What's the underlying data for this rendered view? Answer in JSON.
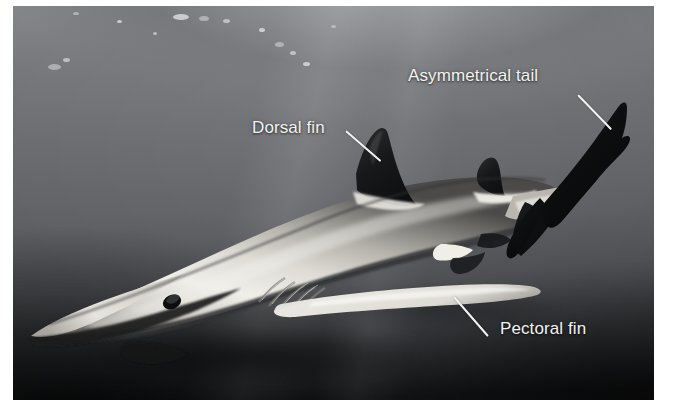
{
  "figure": {
    "kind": "photograph-with-callout-labels",
    "background_color": "#ffffff",
    "photo": {
      "left": 13,
      "top": 6,
      "width": 641,
      "height": 394,
      "water_color_light": "#8c8e91",
      "water_color_mid": "#65676b",
      "water_color_dark": "#141517",
      "shark_body_light": "#e8e6e0",
      "shark_body_mid": "#b9b7b1",
      "shark_body_shadow": "#3a3b3d",
      "shark_fin_dark": "#18191b"
    }
  },
  "labels": [
    {
      "id": "asymmetrical-tail",
      "text": "Asymmetrical tail",
      "text_left": 395,
      "text_top": 60,
      "leader_x": 565,
      "leader_y": 88,
      "leader_len": 48,
      "leader_angle": 46,
      "color": "#f3f3f1"
    },
    {
      "id": "dorsal-fin",
      "text": "Dorsal fin",
      "text_left": 239,
      "text_top": 112,
      "leader_x": 333,
      "leader_y": 124,
      "leader_len": 46,
      "leader_angle": 41,
      "color": "#f3f3f1"
    },
    {
      "id": "pectoral-fin",
      "text": "Pectoral fin",
      "text_left": 487,
      "text_top": 313,
      "leader_x": 441,
      "leader_y": 290,
      "leader_len": 52,
      "leader_angle": 49,
      "color": "#f3f3f1"
    }
  ],
  "bubbles": [
    {
      "x": 35,
      "y": 58,
      "w": 13,
      "h": 6
    },
    {
      "x": 50,
      "y": 52,
      "w": 7,
      "h": 4
    },
    {
      "x": 160,
      "y": 8,
      "w": 16,
      "h": 6
    },
    {
      "x": 186,
      "y": 10,
      "w": 10,
      "h": 5
    },
    {
      "x": 210,
      "y": 13,
      "w": 7,
      "h": 4
    },
    {
      "x": 246,
      "y": 22,
      "w": 6,
      "h": 4
    },
    {
      "x": 262,
      "y": 36,
      "w": 9,
      "h": 5
    },
    {
      "x": 277,
      "y": 45,
      "w": 6,
      "h": 4
    },
    {
      "x": 290,
      "y": 56,
      "w": 7,
      "h": 4
    },
    {
      "x": 318,
      "y": 19,
      "w": 5,
      "h": 3
    },
    {
      "x": 140,
      "y": 26,
      "w": 4,
      "h": 3
    },
    {
      "x": 104,
      "y": 14,
      "w": 5,
      "h": 3
    },
    {
      "x": 60,
      "y": 6,
      "w": 6,
      "h": 3
    }
  ]
}
